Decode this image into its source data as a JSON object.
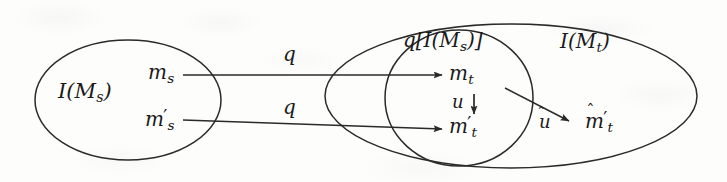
{
  "figure": {
    "kind": "set-mapping-diagram",
    "width": 727,
    "height": 182,
    "background_color": "#fdfdfc",
    "ink_color": "#2a2a2a"
  },
  "regions": {
    "source_set": {
      "name": "source-set-ellipse",
      "label": "I(M",
      "label_sub": "s",
      "label_close": ")",
      "label_plain": "I(M_s)"
    },
    "image_subset": {
      "name": "image-subset-circle",
      "label_prefix": "q[I(M",
      "label_sub": "s",
      "label_suffix": ")]",
      "label_plain": "q[I(M_s)]"
    },
    "target_set": {
      "name": "target-set-ellipse",
      "label": "I(M",
      "label_sub": "t",
      "label_close": ")",
      "label_plain": "I(M_t)"
    }
  },
  "elements": [
    {
      "id": "m_s",
      "base": "m",
      "sub": "s",
      "prime": false,
      "hat": false,
      "plain": "m_s"
    },
    {
      "id": "m_s_prime",
      "base": "m",
      "sub": "s",
      "prime": true,
      "hat": false,
      "plain": "m'_s"
    },
    {
      "id": "m_t",
      "base": "m",
      "sub": "t",
      "prime": false,
      "hat": false,
      "plain": "m_t"
    },
    {
      "id": "m_t_prime",
      "base": "m",
      "sub": "t",
      "prime": true,
      "hat": false,
      "plain": "m'_t"
    },
    {
      "id": "m_t_hat_prime",
      "base": "m",
      "sub": "t",
      "prime": true,
      "hat": true,
      "plain": "m-hat'_t"
    }
  ],
  "arrows": [
    {
      "id": "q-upper",
      "label": "q",
      "from": "m_s",
      "to": "m_t",
      "hat": false
    },
    {
      "id": "q-lower",
      "label": "q",
      "from": "m_s_prime",
      "to": "m_t_prime",
      "hat": false
    },
    {
      "id": "u",
      "label": "u",
      "from": "m_t",
      "to": "m_t_prime",
      "hat": false
    },
    {
      "id": "u-hat",
      "label": "u",
      "from": "m_t",
      "to": "m_t_hat_prime",
      "hat": true
    }
  ]
}
